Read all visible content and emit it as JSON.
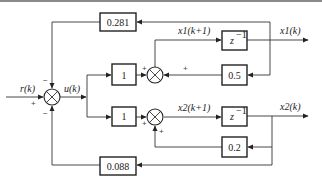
{
  "diagram": {
    "type": "discrete-time state-feedback block diagram",
    "input": {
      "label": "r(k)"
    },
    "control": {
      "label": "u(k)"
    },
    "blocks": {
      "k1_gain": {
        "label": "0.281"
      },
      "k2_gain": {
        "label": "0.088"
      },
      "b1_gain": {
        "label": "1"
      },
      "b2_gain": {
        "label": "1"
      },
      "delay1": {
        "label": "z",
        "sup": "−1"
      },
      "delay2": {
        "label": "z",
        "sup": "−1"
      },
      "a1_gain": {
        "label": "0.5"
      },
      "a2_gain": {
        "label": "0.2"
      }
    },
    "signals": {
      "x1_next": "x1(k+1)",
      "x2_next": "x2(k+1)",
      "x1_out": "x1(k)",
      "x2_out": "x2(k)"
    },
    "signs": {
      "main_r": "+",
      "main_top": "−",
      "main_bottom": "−",
      "sum1_left": "+",
      "sum1_right": "+",
      "sum2_left": "+",
      "sum2_bottom": "+"
    }
  }
}
